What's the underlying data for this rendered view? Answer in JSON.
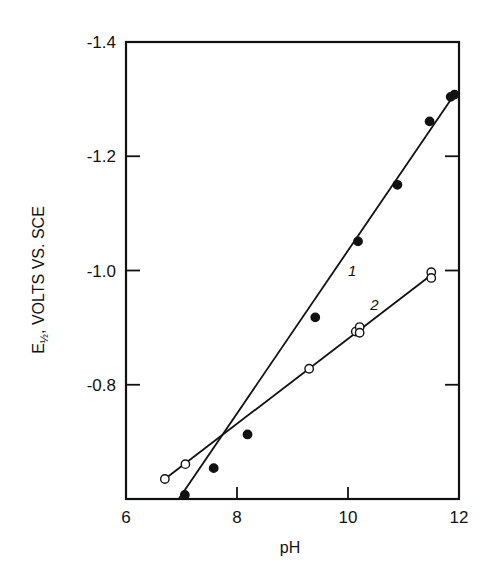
{
  "chart_data": {
    "type": "scatter",
    "title": "",
    "xlabel": "pH",
    "ylabel": "E½, VOLTS VS. SCE",
    "ylabel_parts": {
      "main": "E",
      "subscript": "½",
      "rest": ", VOLTS VS. SCE"
    },
    "xlim": [
      6,
      12
    ],
    "ylim": [
      -0.6,
      -1.4
    ],
    "x_ticks": [
      6,
      8,
      10,
      12
    ],
    "x_tick_labels": [
      "6",
      "8",
      "10",
      "12"
    ],
    "y_ticks": [
      -0.8,
      -1.0,
      -1.2,
      -1.4
    ],
    "y_tick_labels": [
      "-0.8",
      "-1.0",
      "-1.2",
      "-1.4"
    ],
    "grid": false,
    "legend": "none",
    "series": [
      {
        "name": "1",
        "marker": "filled-circle",
        "x": [
          7.06,
          7.58,
          8.19,
          9.41,
          10.18,
          10.89,
          11.47,
          11.85,
          11.92
        ],
        "y": [
          -0.607,
          -0.654,
          -0.713,
          -0.918,
          -1.051,
          -1.15,
          -1.261,
          -1.304,
          -1.308
        ],
        "fit_line": {
          "x": [
            6.95,
            11.95
          ],
          "y": [
            -0.6,
            -1.313
          ]
        },
        "label": "1",
        "label_pos": {
          "x": 10.0,
          "y": -0.99
        }
      },
      {
        "name": "2",
        "marker": "open-circle",
        "x": [
          6.7,
          7.07,
          9.3,
          10.14,
          10.21,
          10.21,
          11.5,
          11.5
        ],
        "y": [
          -0.635,
          -0.661,
          -0.828,
          -0.893,
          -0.901,
          -0.891,
          -0.997,
          -0.987
        ],
        "fit_line": {
          "x": [
            6.7,
            11.5
          ],
          "y": [
            -0.635,
            -0.992
          ]
        },
        "label": "2",
        "label_pos": {
          "x": 10.4,
          "y": -0.93
        }
      }
    ],
    "annotations": [
      "1",
      "2"
    ]
  }
}
